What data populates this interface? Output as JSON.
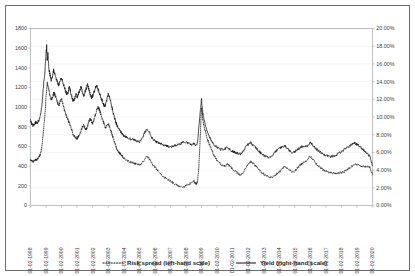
{
  "chart_data": {
    "type": "line",
    "title": "",
    "subtitle": "",
    "xlabel": "",
    "ylabel": "",
    "y2label": "",
    "grid": true,
    "legend_position": "bottom",
    "x_tick_labels": [
      "01-02-1998",
      "01-02-1999",
      "01-02-2000",
      "01-02-2001",
      "01-02-2002",
      "01-02-2003",
      "01-02-2004",
      "01-02-2005",
      "01-02-2006",
      "01-02-2007",
      "01-02-2008",
      "01-02-2009",
      "01-02-2010",
      "01-02-2011",
      "01-02-2012",
      "01-02-2013",
      "01-02-2014",
      "01-02-2015",
      "01-02-2016",
      "01-02-2017",
      "01-02-2018",
      "01-02-2019",
      "01-02-2020"
    ],
    "left_axis": {
      "tick_labels": [
        "0",
        "200",
        "400",
        "600",
        "800",
        "1000",
        "1200",
        "1400",
        "1600",
        "1800"
      ],
      "values": [
        0,
        200,
        400,
        600,
        800,
        1000,
        1200,
        1400,
        1600,
        1800
      ],
      "ylim": [
        0,
        1800
      ]
    },
    "right_axis": {
      "tick_labels": [
        "0.00%",
        "2.00%",
        "4.00%",
        "6.00%",
        "8.00%",
        "10.00%",
        "12.00%",
        "14.00%",
        "16.00%",
        "18.00%",
        "20.00%"
      ],
      "values": [
        0,
        2,
        4,
        6,
        8,
        10,
        12,
        14,
        16,
        18,
        20
      ],
      "ylim": [
        0,
        20
      ]
    },
    "series": [
      {
        "name": "Risk spread (left-hand scale)",
        "axis": "left",
        "style": "dotted",
        "color": "#111111",
        "x": [
          1998.0,
          1998.08,
          1998.17,
          1998.25,
          1998.33,
          1998.42,
          1998.5,
          1998.58,
          1998.67,
          1998.75,
          1998.83,
          1998.92,
          1999.0,
          1999.08,
          1999.17,
          1999.25,
          1999.33,
          1999.42,
          1999.5,
          1999.58,
          1999.67,
          1999.75,
          1999.83,
          1999.92,
          2000.0,
          2000.08,
          2000.17,
          2000.25,
          2000.33,
          2000.42,
          2000.5,
          2000.58,
          2000.67,
          2000.75,
          2000.83,
          2000.92,
          2001.0,
          2001.08,
          2001.17,
          2001.25,
          2001.33,
          2001.42,
          2001.5,
          2001.58,
          2001.67,
          2001.75,
          2001.83,
          2001.92,
          2002.0,
          2002.08,
          2002.17,
          2002.25,
          2002.33,
          2002.42,
          2002.5,
          2002.58,
          2002.67,
          2002.75,
          2002.83,
          2002.92,
          2003.0,
          2003.08,
          2003.17,
          2003.25,
          2003.33,
          2003.42,
          2003.5,
          2003.58,
          2003.67,
          2003.75,
          2003.83,
          2003.92,
          2004.0,
          2004.17,
          2004.33,
          2004.5,
          2004.67,
          2004.83,
          2005.0,
          2005.17,
          2005.33,
          2005.5,
          2005.67,
          2005.83,
          2006.0,
          2006.17,
          2006.33,
          2006.5,
          2006.67,
          2006.83,
          2007.0,
          2007.17,
          2007.33,
          2007.5,
          2007.67,
          2007.83,
          2008.0,
          2008.17,
          2008.33,
          2008.5,
          2008.58,
          2008.67,
          2008.75,
          2008.83,
          2008.92,
          2009.0,
          2009.08,
          2009.17,
          2009.33,
          2009.5,
          2009.67,
          2009.83,
          2010.0,
          2010.17,
          2010.33,
          2010.5,
          2010.67,
          2010.83,
          2011.0,
          2011.17,
          2011.33,
          2011.5,
          2011.67,
          2011.83,
          2012.0,
          2012.17,
          2012.33,
          2012.5,
          2012.67,
          2012.83,
          2013.0,
          2013.17,
          2013.33,
          2013.5,
          2013.67,
          2013.83,
          2014.0,
          2014.17,
          2014.33,
          2014.5,
          2014.67,
          2014.83,
          2015.0,
          2015.17,
          2015.33,
          2015.5,
          2015.67,
          2015.83,
          2016.0,
          2016.17,
          2016.33,
          2016.5,
          2016.67,
          2016.83,
          2017.0,
          2017.17,
          2017.33,
          2017.5,
          2017.67,
          2017.83,
          2018.0,
          2018.17,
          2018.33,
          2018.5,
          2018.67,
          2018.83,
          2019.0,
          2019.17,
          2019.33,
          2019.5,
          2019.67,
          2019.83,
          2020.0
        ],
        "values": [
          470,
          450,
          445,
          455,
          470,
          465,
          480,
          500,
          540,
          620,
          760,
          900,
          1100,
          1240,
          1180,
          1120,
          1080,
          1100,
          1150,
          1120,
          1080,
          1040,
          1020,
          1060,
          1080,
          1030,
          980,
          940,
          900,
          870,
          840,
          800,
          760,
          720,
          700,
          690,
          680,
          700,
          720,
          760,
          800,
          820,
          790,
          770,
          800,
          850,
          880,
          860,
          830,
          870,
          920,
          960,
          1000,
          980,
          940,
          900,
          860,
          820,
          790,
          810,
          830,
          800,
          760,
          720,
          680,
          640,
          600,
          570,
          545,
          530,
          515,
          500,
          480,
          460,
          450,
          440,
          430,
          420,
          415,
          430,
          470,
          500,
          470,
          420,
          390,
          360,
          330,
          300,
          280,
          265,
          250,
          230,
          215,
          200,
          195,
          190,
          200,
          215,
          230,
          250,
          230,
          220,
          250,
          400,
          700,
          1000,
          880,
          800,
          700,
          620,
          560,
          500,
          455,
          430,
          410,
          400,
          420,
          400,
          370,
          350,
          330,
          310,
          330,
          380,
          420,
          450,
          430,
          400,
          370,
          340,
          320,
          300,
          290,
          285,
          300,
          320,
          340,
          370,
          400,
          380,
          360,
          340,
          350,
          380,
          410,
          430,
          450,
          470,
          500,
          470,
          430,
          400,
          380,
          360,
          350,
          340,
          335,
          330,
          325,
          330,
          335,
          345,
          360,
          380,
          400,
          420,
          415,
          410,
          400,
          395,
          400,
          390,
          310
        ]
      },
      {
        "name": "Yield (right-hand scale)",
        "axis": "right",
        "style": "solid",
        "color": "#111111",
        "x": [
          1998.0,
          1998.08,
          1998.17,
          1998.25,
          1998.33,
          1998.42,
          1998.5,
          1998.58,
          1998.67,
          1998.75,
          1998.83,
          1998.92,
          1999.0,
          1999.04,
          1999.08,
          1999.12,
          1999.17,
          1999.25,
          1999.33,
          1999.42,
          1999.5,
          1999.58,
          1999.67,
          1999.75,
          1999.83,
          1999.92,
          2000.0,
          2000.08,
          2000.17,
          2000.25,
          2000.33,
          2000.42,
          2000.5,
          2000.58,
          2000.67,
          2000.75,
          2000.83,
          2000.92,
          2001.0,
          2001.08,
          2001.17,
          2001.25,
          2001.33,
          2001.42,
          2001.5,
          2001.58,
          2001.67,
          2001.75,
          2001.83,
          2001.92,
          2002.0,
          2002.08,
          2002.17,
          2002.25,
          2002.33,
          2002.42,
          2002.5,
          2002.58,
          2002.67,
          2002.75,
          2002.83,
          2002.92,
          2003.0,
          2003.08,
          2003.17,
          2003.25,
          2003.33,
          2003.42,
          2003.5,
          2003.58,
          2003.67,
          2003.75,
          2003.83,
          2003.92,
          2004.0,
          2004.17,
          2004.33,
          2004.5,
          2004.67,
          2004.83,
          2005.0,
          2005.17,
          2005.33,
          2005.5,
          2005.67,
          2005.83,
          2006.0,
          2006.17,
          2006.33,
          2006.5,
          2006.67,
          2006.83,
          2007.0,
          2007.17,
          2007.33,
          2007.5,
          2007.67,
          2007.83,
          2008.0,
          2008.17,
          2008.33,
          2008.5,
          2008.58,
          2008.67,
          2008.75,
          2008.83,
          2008.92,
          2009.0,
          2009.08,
          2009.17,
          2009.33,
          2009.5,
          2009.67,
          2009.83,
          2010.0,
          2010.17,
          2010.33,
          2010.5,
          2010.67,
          2010.83,
          2011.0,
          2011.17,
          2011.33,
          2011.5,
          2011.67,
          2011.83,
          2012.0,
          2012.17,
          2012.33,
          2012.5,
          2012.67,
          2012.83,
          2013.0,
          2013.17,
          2013.33,
          2013.5,
          2013.67,
          2013.83,
          2014.0,
          2014.17,
          2014.33,
          2014.5,
          2014.67,
          2014.83,
          2015.0,
          2015.17,
          2015.33,
          2015.5,
          2015.67,
          2015.83,
          2016.0,
          2016.17,
          2016.33,
          2016.5,
          2016.67,
          2016.83,
          2017.0,
          2017.17,
          2017.33,
          2017.5,
          2017.67,
          2017.83,
          2018.0,
          2018.17,
          2018.33,
          2018.5,
          2018.67,
          2018.83,
          2019.0,
          2019.17,
          2019.33,
          2019.5,
          2019.67,
          2019.83,
          2020.0
        ],
        "values": [
          9.6,
          9.2,
          9.0,
          9.2,
          9.4,
          9.3,
          9.5,
          9.8,
          10.4,
          11.6,
          13.4,
          15.0,
          17.0,
          18.0,
          16.4,
          17.2,
          15.6,
          14.8,
          14.2,
          14.6,
          15.4,
          14.8,
          14.2,
          13.8,
          13.6,
          14.2,
          14.5,
          14.0,
          13.4,
          13.0,
          12.6,
          12.8,
          13.4,
          12.8,
          12.2,
          11.8,
          12.0,
          12.6,
          12.2,
          12.6,
          13.0,
          13.4,
          12.8,
          12.4,
          12.8,
          13.2,
          13.6,
          13.2,
          12.6,
          12.2,
          12.4,
          12.8,
          13.2,
          13.6,
          13.2,
          12.8,
          12.4,
          12.0,
          11.6,
          11.2,
          11.4,
          12.0,
          12.6,
          12.2,
          11.6,
          11.0,
          10.4,
          9.8,
          9.4,
          9.0,
          8.7,
          8.5,
          8.3,
          8.1,
          7.9,
          7.7,
          7.6,
          7.5,
          7.4,
          7.3,
          7.2,
          7.5,
          8.2,
          8.6,
          8.2,
          7.6,
          7.3,
          7.1,
          7.0,
          6.9,
          6.8,
          6.7,
          6.6,
          6.7,
          6.8,
          6.9,
          7.0,
          7.1,
          7.2,
          7.0,
          6.9,
          7.0,
          6.9,
          6.8,
          7.2,
          8.8,
          10.6,
          12.1,
          10.4,
          9.6,
          8.6,
          7.8,
          7.2,
          6.8,
          6.6,
          6.4,
          6.3,
          6.4,
          6.6,
          6.3,
          6.1,
          6.0,
          5.9,
          5.8,
          6.1,
          6.6,
          6.9,
          7.1,
          6.8,
          6.5,
          6.2,
          5.9,
          5.7,
          5.5,
          5.4,
          5.6,
          5.9,
          6.2,
          6.4,
          6.6,
          6.8,
          6.5,
          6.2,
          6.0,
          6.1,
          6.3,
          6.5,
          6.7,
          6.6,
          6.8,
          7.1,
          6.8,
          6.5,
          6.2,
          6.0,
          5.8,
          5.7,
          5.6,
          5.5,
          5.6,
          5.7,
          5.9,
          6.1,
          6.3,
          6.5,
          6.7,
          6.9,
          7.1,
          6.9,
          6.7,
          6.4,
          6.1,
          5.8,
          5.6,
          4.5
        ]
      }
    ]
  },
  "legend": {
    "items": [
      {
        "label": "Risk spread (left-hand scale)",
        "style": "dotted"
      },
      {
        "label": "Yield (right-hand scale)",
        "style": "solid"
      }
    ]
  }
}
